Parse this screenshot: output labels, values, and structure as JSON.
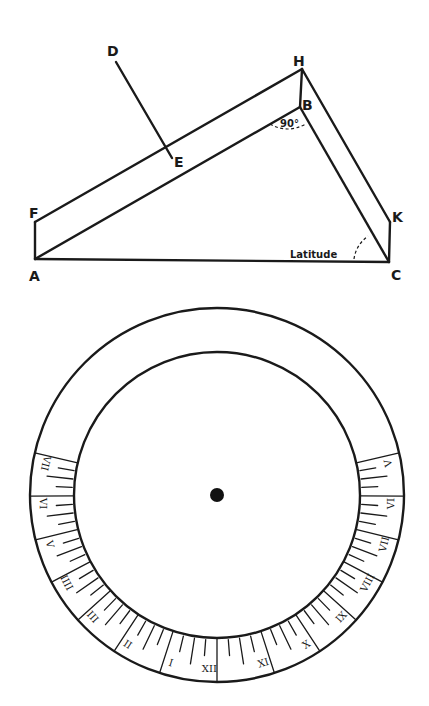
{
  "figure": {
    "triangle_diagram": {
      "points": {
        "A": {
          "label": "A",
          "x": 35,
          "y": 259
        },
        "B": {
          "label": "B",
          "x": 300,
          "y": 107
        },
        "C": {
          "label": "C",
          "x": 389,
          "y": 262
        },
        "D": {
          "label": "D",
          "x": 116,
          "y": 62
        },
        "E": {
          "label": "E",
          "x": 172,
          "y": 158
        },
        "F": {
          "label": "F",
          "x": 35,
          "y": 222
        },
        "H": {
          "label": "H",
          "x": 302,
          "y": 69
        },
        "K": {
          "label": "K",
          "x": 390,
          "y": 222
        }
      },
      "angle_label_right": "90°",
      "angle_label_latitude": "Latitude"
    },
    "dial": {
      "center": {
        "x": 217,
        "y": 495
      },
      "outer_radius": 187,
      "inner_radius": 143,
      "hour_labels_left_top_to_bottom": [
        "VII",
        "VI",
        "V",
        "IIII",
        "III",
        "II",
        "I"
      ],
      "hour_label_bottom": "XII",
      "hour_labels_right_bottom_to_top": [
        "XI",
        "X",
        "IX",
        "VIII",
        "VII",
        "VI",
        "V"
      ]
    }
  }
}
